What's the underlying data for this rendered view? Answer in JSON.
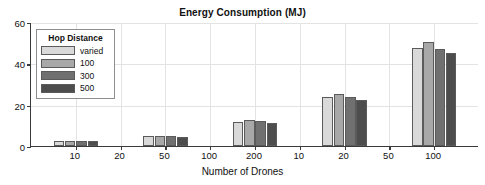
{
  "chart_data": {
    "type": "bar",
    "title": "Energy Consumption (MJ)",
    "xlabel": "Number of Drones",
    "ylabel": "",
    "ylim": [
      0,
      60
    ],
    "yticks": [
      0,
      20,
      40,
      60
    ],
    "ytick_labels": [
      "0",
      "20",
      "40",
      "60"
    ],
    "xtick_labels": [
      "10",
      "20",
      "50",
      "100",
      "200",
      "10",
      "20",
      "50",
      "100"
    ],
    "categories": [
      "10",
      "50",
      "200",
      "20",
      "100"
    ],
    "grid": true,
    "legend_position": "upper-left",
    "series": [
      {
        "name": "varied",
        "color": "#d9d9d9",
        "values": [
          2.4,
          4.8,
          11.8,
          23.6,
          47.3
        ]
      },
      {
        "name": "100",
        "color": "#a8a8a8",
        "values": [
          2.4,
          4.9,
          12.5,
          25.3,
          50.5
        ]
      },
      {
        "name": "300",
        "color": "#707070",
        "values": [
          2.3,
          4.7,
          11.9,
          23.5,
          47.1
        ]
      },
      {
        "name": "500",
        "color": "#4d4d4d",
        "values": [
          2.2,
          4.5,
          11.2,
          22.4,
          45.0
        ]
      }
    ]
  },
  "legend": {
    "title": "Hop Distance",
    "items": [
      {
        "label": "varied"
      },
      {
        "label": "100"
      },
      {
        "label": "300"
      },
      {
        "label": "500"
      }
    ]
  }
}
